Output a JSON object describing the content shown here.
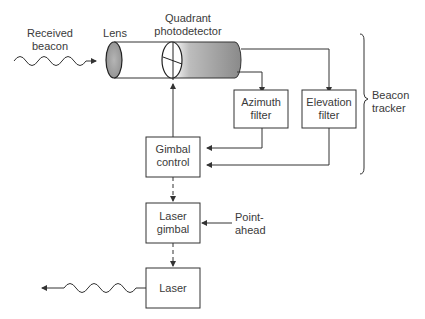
{
  "labels": {
    "received_beacon": [
      "Received",
      "beacon"
    ],
    "lens": "Lens",
    "quadrant_photodetector": [
      "Quadrant",
      "photodetector"
    ],
    "azimuth_filter": [
      "Azimuth",
      "filter"
    ],
    "elevation_filter": [
      "Elevation",
      "filter"
    ],
    "beacon_tracker": [
      "Beacon",
      "tracker"
    ],
    "gimbal_control": [
      "Gimbal",
      "control"
    ],
    "laser_gimbal": [
      "Laser",
      "gimbal"
    ],
    "point_ahead": [
      "Point-",
      "ahead"
    ],
    "laser": "Laser"
  },
  "colors": {
    "line": "#333333",
    "text": "#3a3a3a",
    "lens_fill": "#9a9a9a",
    "detector_shade": "#8a8a8a"
  }
}
